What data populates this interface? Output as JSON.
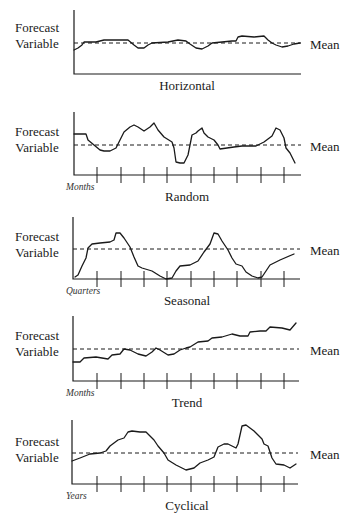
{
  "chart_data": [
    {
      "type": "line",
      "title": "Horizontal",
      "ylabel": "Forecast Variable",
      "xlabel": "",
      "mean_label": "Mean",
      "ticks": false,
      "mean": 43,
      "description": "Values fluctuate closely around a constant mean",
      "points": [
        [
          74,
          50
        ],
        [
          78,
          48
        ],
        [
          82,
          45
        ],
        [
          84,
          42
        ],
        [
          96,
          42
        ],
        [
          104,
          40
        ],
        [
          128,
          40
        ],
        [
          134,
          45
        ],
        [
          138,
          48
        ],
        [
          144,
          48
        ],
        [
          148,
          45
        ],
        [
          152,
          43
        ],
        [
          168,
          42
        ],
        [
          178,
          40
        ],
        [
          186,
          41
        ],
        [
          190,
          44
        ],
        [
          196,
          48
        ],
        [
          202,
          49
        ],
        [
          208,
          46
        ],
        [
          212,
          43
        ],
        [
          222,
          42
        ],
        [
          232,
          41
        ],
        [
          236,
          41
        ],
        [
          238,
          37
        ],
        [
          242,
          36
        ],
        [
          254,
          37
        ],
        [
          264,
          36
        ],
        [
          268,
          40
        ],
        [
          272,
          43
        ],
        [
          276,
          45
        ],
        [
          282,
          47
        ],
        [
          288,
          46
        ],
        [
          294,
          44
        ],
        [
          300,
          43
        ]
      ]
    },
    {
      "type": "line",
      "title": "Random",
      "ylabel": "Forecast Variable",
      "xlabel": "Months",
      "mean_label": "Mean",
      "ticks": true,
      "mean": 145,
      "description": "Irregular, unpredictable fluctuations around a mean",
      "points": [
        [
          74,
          134
        ],
        [
          86,
          134
        ],
        [
          88,
          140
        ],
        [
          94,
          145
        ],
        [
          100,
          150
        ],
        [
          104,
          151
        ],
        [
          110,
          151
        ],
        [
          116,
          148
        ],
        [
          120,
          140
        ],
        [
          124,
          132
        ],
        [
          130,
          127
        ],
        [
          134,
          125
        ],
        [
          138,
          127
        ],
        [
          144,
          131
        ],
        [
          150,
          127
        ],
        [
          154,
          123
        ],
        [
          158,
          130
        ],
        [
          164,
          137
        ],
        [
          172,
          142
        ],
        [
          174,
          148
        ],
        [
          176,
          162
        ],
        [
          180,
          163
        ],
        [
          184,
          163
        ],
        [
          188,
          155
        ],
        [
          190,
          145
        ],
        [
          192,
          135
        ],
        [
          196,
          133
        ],
        [
          198,
          131
        ],
        [
          202,
          128
        ],
        [
          204,
          133
        ],
        [
          208,
          137
        ],
        [
          214,
          140
        ],
        [
          218,
          145
        ],
        [
          220,
          149
        ],
        [
          234,
          147
        ],
        [
          242,
          146
        ],
        [
          256,
          146
        ],
        [
          264,
          142
        ],
        [
          272,
          136
        ],
        [
          276,
          128
        ],
        [
          280,
          130
        ],
        [
          284,
          138
        ],
        [
          286,
          148
        ],
        [
          290,
          153
        ],
        [
          295,
          163
        ]
      ]
    },
    {
      "type": "line",
      "title": "Seasonal",
      "ylabel": "Forecast Variable",
      "xlabel": "Quarters",
      "mean_label": "Mean",
      "ticks": true,
      "mean": 249,
      "description": "Repeating pattern with peaks and troughs at regular intervals",
      "points": [
        [
          75,
          277
        ],
        [
          78,
          275
        ],
        [
          82,
          266
        ],
        [
          86,
          258
        ],
        [
          88,
          248
        ],
        [
          92,
          244
        ],
        [
          100,
          243
        ],
        [
          110,
          242
        ],
        [
          114,
          240
        ],
        [
          116,
          233
        ],
        [
          120,
          233
        ],
        [
          124,
          238
        ],
        [
          130,
          247
        ],
        [
          134,
          257
        ],
        [
          138,
          266
        ],
        [
          142,
          268
        ],
        [
          152,
          271
        ],
        [
          160,
          276
        ],
        [
          166,
          279
        ],
        [
          172,
          278
        ],
        [
          176,
          271
        ],
        [
          180,
          266
        ],
        [
          190,
          265
        ],
        [
          198,
          261
        ],
        [
          204,
          252
        ],
        [
          210,
          244
        ],
        [
          214,
          233
        ],
        [
          218,
          234
        ],
        [
          222,
          241
        ],
        [
          228,
          250
        ],
        [
          232,
          258
        ],
        [
          236,
          264
        ],
        [
          242,
          266
        ],
        [
          246,
          272
        ],
        [
          252,
          276
        ],
        [
          258,
          278
        ],
        [
          262,
          277
        ],
        [
          266,
          271
        ],
        [
          270,
          265
        ],
        [
          280,
          260
        ],
        [
          294,
          254
        ]
      ]
    },
    {
      "type": "line",
      "title": "Trend",
      "ylabel": "Forecast Variable",
      "xlabel": "Months",
      "mean_label": "Mean",
      "ticks": true,
      "mean": 349,
      "description": "Values steadily increase over time",
      "points": [
        [
          73,
          362
        ],
        [
          80,
          362
        ],
        [
          84,
          358
        ],
        [
          96,
          357
        ],
        [
          108,
          359
        ],
        [
          112,
          355
        ],
        [
          120,
          354
        ],
        [
          124,
          349
        ],
        [
          130,
          350
        ],
        [
          138,
          354
        ],
        [
          146,
          356
        ],
        [
          152,
          352
        ],
        [
          156,
          348
        ],
        [
          160,
          350
        ],
        [
          168,
          355
        ],
        [
          174,
          354
        ],
        [
          180,
          350
        ],
        [
          186,
          348
        ],
        [
          190,
          347
        ],
        [
          198,
          342
        ],
        [
          208,
          341
        ],
        [
          212,
          338
        ],
        [
          222,
          337
        ],
        [
          232,
          334
        ],
        [
          240,
          336
        ],
        [
          248,
          336
        ],
        [
          250,
          332
        ],
        [
          260,
          331
        ],
        [
          266,
          331
        ],
        [
          270,
          327
        ],
        [
          282,
          328
        ],
        [
          290,
          330
        ],
        [
          296,
          323
        ]
      ]
    },
    {
      "type": "line",
      "title": "Cyclical",
      "ylabel": "Forecast Variable",
      "xlabel": "Years",
      "mean_label": "Mean",
      "ticks": true,
      "mean": 453,
      "description": "Long wave-like fluctuations above and below the mean over years",
      "points": [
        [
          72,
          461
        ],
        [
          80,
          458
        ],
        [
          90,
          454
        ],
        [
          100,
          453
        ],
        [
          106,
          451
        ],
        [
          110,
          446
        ],
        [
          118,
          440
        ],
        [
          124,
          438
        ],
        [
          128,
          432
        ],
        [
          132,
          431
        ],
        [
          140,
          432
        ],
        [
          146,
          432
        ],
        [
          150,
          436
        ],
        [
          154,
          440
        ],
        [
          158,
          446
        ],
        [
          164,
          453
        ],
        [
          168,
          460
        ],
        [
          176,
          465
        ],
        [
          186,
          470
        ],
        [
          194,
          468
        ],
        [
          200,
          463
        ],
        [
          208,
          460
        ],
        [
          214,
          457
        ],
        [
          218,
          447
        ],
        [
          224,
          444
        ],
        [
          228,
          444
        ],
        [
          232,
          446
        ],
        [
          236,
          448
        ],
        [
          238,
          444
        ],
        [
          242,
          426
        ],
        [
          246,
          425
        ],
        [
          254,
          431
        ],
        [
          258,
          435
        ],
        [
          262,
          439
        ],
        [
          264,
          444
        ],
        [
          268,
          446
        ],
        [
          272,
          458
        ],
        [
          276,
          464
        ],
        [
          284,
          465
        ],
        [
          290,
          468
        ],
        [
          296,
          464
        ]
      ]
    }
  ],
  "panels": [
    {
      "ylabel_line1": "Forecast",
      "ylabel_line2": "Variable",
      "mean_label": "Mean",
      "unit": "",
      "title": "Horizontal"
    },
    {
      "ylabel_line1": "Forecast",
      "ylabel_line2": "Variable",
      "mean_label": "Mean",
      "unit": "Months",
      "title": "Random"
    },
    {
      "ylabel_line1": "Forecast",
      "ylabel_line2": "Variable",
      "mean_label": "Mean",
      "unit": "Quarters",
      "title": "Seasonal"
    },
    {
      "ylabel_line1": "Forecast",
      "ylabel_line2": "Variable",
      "mean_label": "Mean",
      "unit": "Months",
      "title": "Trend"
    },
    {
      "ylabel_line1": "Forecast",
      "ylabel_line2": "Variable",
      "mean_label": "Mean",
      "unit": "Years",
      "title": "Cyclical"
    }
  ],
  "colors": {
    "ink": "#1a1a1a",
    "background": "#ffffff"
  }
}
